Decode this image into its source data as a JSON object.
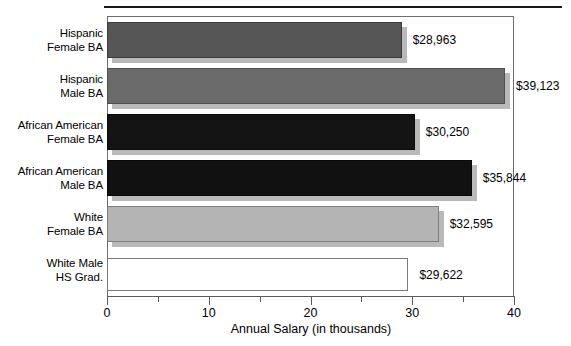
{
  "chart_data": {
    "type": "bar",
    "orientation": "horizontal",
    "title": "",
    "xlabel": "Annual Salary (in thousands)",
    "ylabel": "",
    "xlim": [
      0,
      40
    ],
    "xticks": [
      0,
      10,
      20,
      30,
      40
    ],
    "xtick_labels": [
      "0",
      "10",
      "20",
      "30",
      "40"
    ],
    "xminor_ticks": [
      5,
      15,
      25,
      35
    ],
    "grid": false,
    "legend": "none",
    "categories": [
      "Hispanic Female BA",
      "Hispanic Male BA",
      "African American Female BA",
      "African American Male BA",
      "White Female BA",
      "White Male HS Grad."
    ],
    "values": [
      28.963,
      39.123,
      30.25,
      35.844,
      32.595,
      29.622
    ],
    "data_labels": [
      "$28,963",
      "$39,123",
      "$30,250",
      "$35,844",
      "$32,595",
      "$29,622"
    ],
    "bars": [
      {
        "label_line1": "Hispanic",
        "label_line2": "Female BA",
        "value": 28.963,
        "data_label": "$28,963",
        "fill": "#565656",
        "stroke": "#3d3d3d"
      },
      {
        "label_line1": "Hispanic",
        "label_line2": "Male BA",
        "value": 39.123,
        "data_label": "$39,123",
        "fill": "#6b6b6b",
        "stroke": "#4f4f4f"
      },
      {
        "label_line1": "African American",
        "label_line2": "Female BA",
        "value": 30.25,
        "data_label": "$30,250",
        "fill": "#141414",
        "stroke": "#0a0a0a"
      },
      {
        "label_line1": "African American",
        "label_line2": "Male BA",
        "value": 35.844,
        "data_label": "$35,844",
        "fill": "#111111",
        "stroke": "#080808"
      },
      {
        "label_line1": "White",
        "label_line2": "Female BA",
        "value": 32.595,
        "data_label": "$32,595",
        "fill": "#b4b4b4",
        "stroke": "#7d7d7d"
      },
      {
        "label_line1": "White Male",
        "label_line2": "HS Grad.",
        "value": 29.622,
        "data_label": "$29,622",
        "fill": "#ffffff",
        "stroke": "#787878"
      }
    ]
  },
  "axis": {
    "x_title": "Annual Salary (in thousands)",
    "tick_0": "0",
    "tick_10": "10",
    "tick_20": "20",
    "tick_30": "30",
    "tick_40": "40"
  }
}
